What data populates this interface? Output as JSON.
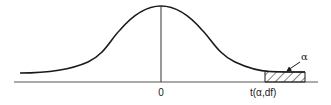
{
  "diagram": {
    "type": "t-distribution-density",
    "labels": {
      "center": "0",
      "critical_value": "t(α,df)",
      "tail_area": "α"
    },
    "colors": {
      "stroke": "#1a1a1a",
      "axis": "#555555",
      "background": "#ffffff"
    }
  }
}
